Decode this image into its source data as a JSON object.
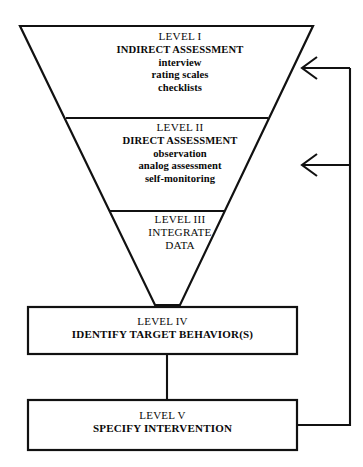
{
  "diagram": {
    "colors": {
      "stroke": "#111111",
      "background": "#ffffff",
      "text": "#0a0a0a"
    },
    "funnel_levels": [
      {
        "id": "level-1",
        "number": "LEVEL I",
        "name": "INDIRECT ASSESSMENT",
        "methods": [
          "interview",
          "rating scales",
          "checklists"
        ]
      },
      {
        "id": "level-2",
        "number": "LEVEL II",
        "name": "DIRECT ASSESSMENT",
        "methods": [
          "observation",
          "analog assessment",
          "self-monitoring"
        ]
      },
      {
        "id": "level-3",
        "number": "LEVEL III",
        "name": "INTEGRATE",
        "name_line2": "DATA",
        "methods": []
      }
    ],
    "boxes": [
      {
        "id": "level-4",
        "number": "LEVEL IV",
        "name": "IDENTIFY TARGET BEHAVIOR(S)"
      },
      {
        "id": "level-5",
        "number": "LEVEL V",
        "name": "SPECIFY INTERVENTION"
      }
    ],
    "connectors": [
      {
        "id": "level4-to-level5",
        "type": "vertical-line"
      },
      {
        "id": "feedback-to-level-1",
        "type": "arrow-left"
      },
      {
        "id": "feedback-to-level-2",
        "type": "arrow-left"
      },
      {
        "id": "feedback-spine",
        "type": "vertical-line"
      }
    ]
  }
}
